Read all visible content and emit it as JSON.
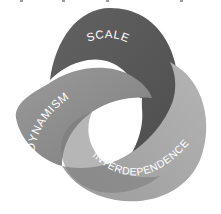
{
  "diagram": {
    "type": "trefoil-knot",
    "rings": [
      {
        "id": "scale",
        "label": "SCALE",
        "color": "#5a5a5a"
      },
      {
        "id": "dynamism",
        "label": "DYNAMISM",
        "color": "#8d8d8d"
      },
      {
        "id": "interdependence",
        "label": "INTERDEPENDENCE",
        "color": "#a9a9a9"
      }
    ],
    "background": "#ffffff"
  }
}
